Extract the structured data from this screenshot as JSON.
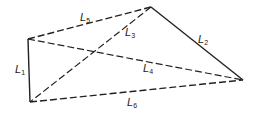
{
  "diagram": {
    "type": "quadrilateral-with-diagonals",
    "vertices": {
      "A": [
        28,
        39
      ],
      "B": [
        151,
        7
      ],
      "C": [
        243,
        80
      ],
      "D": [
        30,
        102
      ]
    },
    "edges": [
      {
        "id": "L1",
        "label": "L",
        "sub": "1",
        "from": "A",
        "to": "D",
        "style": "solid",
        "label_pos": [
          15,
          73
        ]
      },
      {
        "id": "L2",
        "label": "L",
        "sub": "2",
        "from": "B",
        "to": "C",
        "style": "solid",
        "label_pos": [
          198,
          43
        ]
      },
      {
        "id": "L3",
        "label": "L",
        "sub": "3",
        "from": "B",
        "to": "D",
        "style": "dashed",
        "label_pos": [
          125,
          36
        ]
      },
      {
        "id": "L4",
        "label": "L",
        "sub": "4",
        "from": "A",
        "to": "C",
        "style": "dashed",
        "label_pos": [
          143,
          72
        ]
      },
      {
        "id": "L5",
        "label": "L",
        "sub": "5",
        "from": "A",
        "to": "B",
        "style": "dashed",
        "label_pos": [
          80,
          21
        ]
      },
      {
        "id": "L6",
        "label": "L",
        "sub": "6",
        "from": "D",
        "to": "C",
        "style": "dashed",
        "label_pos": [
          127,
          103
        ]
      }
    ]
  },
  "labels": {
    "L1": "L",
    "L1_sub": "1",
    "L2": "L",
    "L2_sub": "2",
    "L3": "L",
    "L3_sub": "3",
    "L4": "L",
    "L4_sub": "4",
    "L5": "L",
    "L5_sub": "5",
    "L6": "L",
    "L6_sub": "6"
  }
}
